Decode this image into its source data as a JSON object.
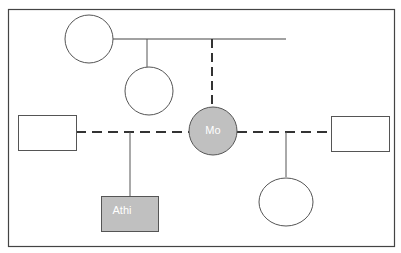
{
  "diagram": {
    "type": "genogram",
    "colors": {
      "stroke": "#555555",
      "border": "#444444",
      "fill_highlight": "#c0c0c0",
      "fill_empty": "#ffffff",
      "label_text": "#ffffff"
    },
    "nodes": [
      {
        "id": "top-left-female",
        "shape": "circle",
        "label": ""
      },
      {
        "id": "middle-female",
        "shape": "circle",
        "label": ""
      },
      {
        "id": "left-male",
        "shape": "square",
        "label": ""
      },
      {
        "id": "mo",
        "shape": "circle",
        "label": "Mo",
        "highlighted": true
      },
      {
        "id": "right-male",
        "shape": "square",
        "label": ""
      },
      {
        "id": "athi",
        "shape": "square",
        "label": "Athi",
        "highlighted": true
      },
      {
        "id": "bottom-right-female",
        "shape": "circle",
        "label": ""
      }
    ],
    "edges": [
      {
        "from": "top-left-female",
        "to": "sibling-line",
        "style": "solid"
      },
      {
        "from": "sibling-line",
        "to": "middle-female",
        "style": "solid"
      },
      {
        "from": "sibling-line",
        "to": "mo",
        "style": "dashed"
      },
      {
        "from": "left-male",
        "to": "mo",
        "style": "dashed",
        "relation": "partnership"
      },
      {
        "from": "mo",
        "to": "right-male",
        "style": "dashed",
        "relation": "partnership"
      },
      {
        "from": "left-male-mo-line",
        "to": "athi",
        "style": "solid",
        "relation": "child"
      },
      {
        "from": "mo-right-male-line",
        "to": "bottom-right-female",
        "style": "solid",
        "relation": "child"
      }
    ]
  }
}
